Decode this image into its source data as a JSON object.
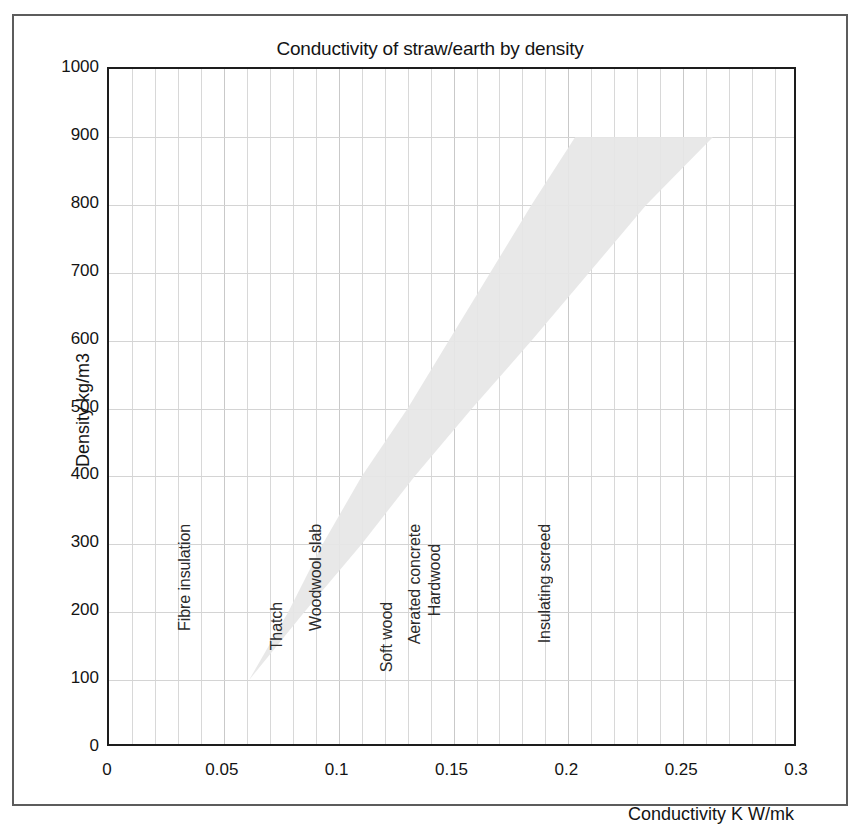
{
  "chart_data": {
    "type": "area",
    "title": "Conductivity of straw/earth by density",
    "xlabel": "Conductivity K W/mk",
    "ylabel": "Density kg/m3",
    "xlim": [
      0,
      0.3
    ],
    "ylim": [
      0,
      1000
    ],
    "xticks": [
      "0",
      "0.05",
      "0.1",
      "0.15",
      "0.2",
      "0.25",
      "0.3"
    ],
    "xtick_values": [
      0,
      0.05,
      0.1,
      0.15,
      0.2,
      0.25,
      0.3
    ],
    "yticks": [
      "0",
      "100",
      "200",
      "300",
      "400",
      "500",
      "600",
      "700",
      "800",
      "900",
      "1000"
    ],
    "ytick_values": [
      0,
      100,
      200,
      300,
      400,
      500,
      600,
      700,
      800,
      900,
      1000
    ],
    "grid": true,
    "legend": "none",
    "series": [
      {
        "name": "Straw/earth conductivity range",
        "kind": "band",
        "description": "Shaded wedge spanning the plausible conductivity range of straw/earth mixtures; widens as density increases.",
        "lower_bound": [
          {
            "density": 100,
            "conductivity": 0.061
          },
          {
            "density": 200,
            "conductivity": 0.078
          },
          {
            "density": 300,
            "conductivity": 0.093
          },
          {
            "density": 400,
            "conductivity": 0.11
          },
          {
            "density": 500,
            "conductivity": 0.13
          },
          {
            "density": 600,
            "conductivity": 0.148
          },
          {
            "density": 700,
            "conductivity": 0.166
          },
          {
            "density": 800,
            "conductivity": 0.184
          },
          {
            "density": 900,
            "conductivity": 0.203
          }
        ],
        "upper_bound": [
          {
            "density": 100,
            "conductivity": 0.061
          },
          {
            "density": 200,
            "conductivity": 0.085
          },
          {
            "density": 300,
            "conductivity": 0.11
          },
          {
            "density": 400,
            "conductivity": 0.133
          },
          {
            "density": 500,
            "conductivity": 0.158
          },
          {
            "density": 600,
            "conductivity": 0.184
          },
          {
            "density": 700,
            "conductivity": 0.209
          },
          {
            "density": 800,
            "conductivity": 0.234
          },
          {
            "density": 900,
            "conductivity": 0.263
          }
        ]
      }
    ],
    "annotations": [
      {
        "label": "Fibre insulation",
        "conductivity": 0.033,
        "density_top": 330
      },
      {
        "label": "Thatch",
        "conductivity": 0.073,
        "density_top": 215
      },
      {
        "label": "Woodwool slab",
        "conductivity": 0.09,
        "density_top": 330
      },
      {
        "label": "Soft wood",
        "conductivity": 0.121,
        "density_top": 215
      },
      {
        "label": "Aerated concrete",
        "conductivity": 0.133,
        "density_top": 330
      },
      {
        "label": "Hardwood",
        "conductivity": 0.142,
        "density_top": 300
      },
      {
        "label": "Insulating screed",
        "conductivity": 0.19,
        "density_top": 330
      }
    ]
  },
  "colors": {
    "band_fill": "#e6e6e6",
    "grid": "#d8d8d8",
    "axis": "#1d1d1d",
    "frame": "#5c5c5c",
    "text": "#141414"
  }
}
